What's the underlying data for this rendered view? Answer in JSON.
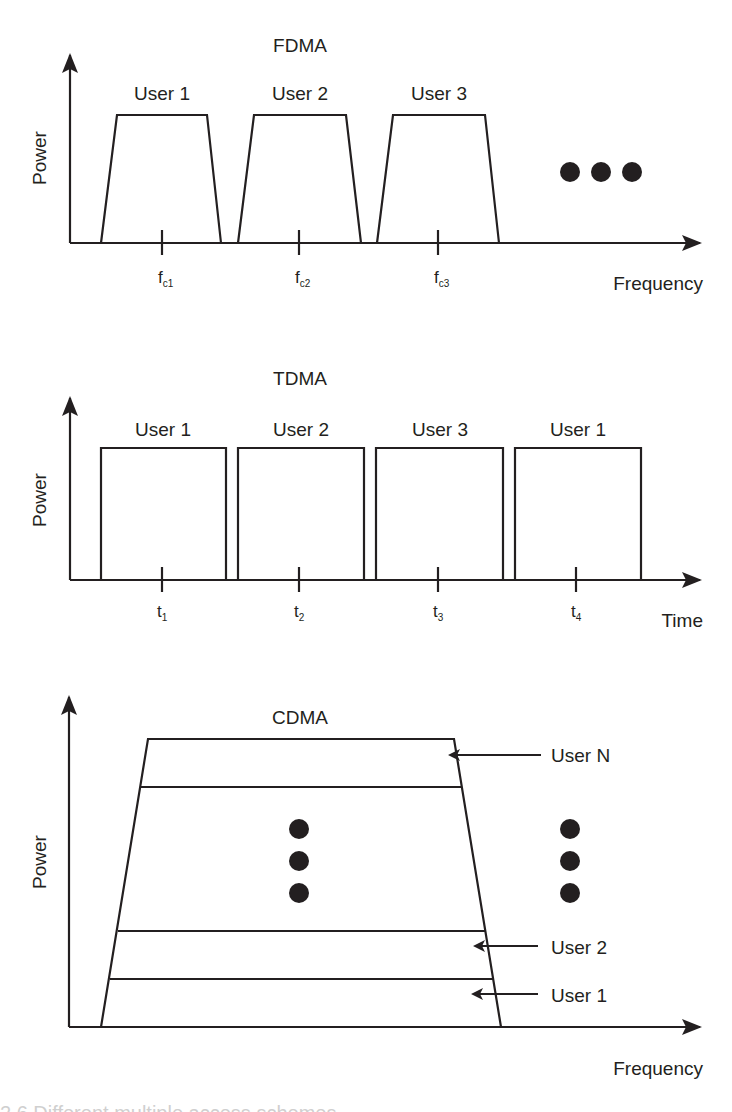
{
  "figure": {
    "caption_partial": "2.6 Different multiple access schemes"
  },
  "colors": {
    "ink": "#231f20",
    "background": "#ffffff"
  },
  "panels": {
    "fdma": {
      "title": "FDMA",
      "y_label": "Power",
      "x_label": "Frequency",
      "users": [
        "User 1",
        "User 2",
        "User 3"
      ],
      "ticks": [
        {
          "base": "f",
          "sub": "c1"
        },
        {
          "base": "f",
          "sub": "c2"
        },
        {
          "base": "f",
          "sub": "c3"
        }
      ],
      "continuation": "ellipsis-horizontal"
    },
    "tdma": {
      "title": "TDMA",
      "y_label": "Power",
      "x_label": "Time",
      "users": [
        "User 1",
        "User 2",
        "User 3",
        "User 1"
      ],
      "ticks": [
        {
          "base": "t",
          "sub": "1"
        },
        {
          "base": "t",
          "sub": "2"
        },
        {
          "base": "t",
          "sub": "3"
        },
        {
          "base": "t",
          "sub": "4"
        }
      ]
    },
    "cdma": {
      "title": "CDMA",
      "y_label": "Power",
      "x_label": "Frequency",
      "layers": [
        "User N",
        "User 2",
        "User 1"
      ],
      "continuation": "ellipsis-vertical"
    }
  }
}
